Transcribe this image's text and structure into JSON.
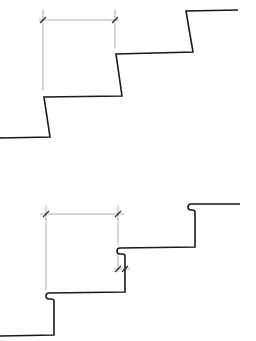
{
  "figure": {
    "diagrams": [
      {
        "id": "top",
        "label": "stair profile with sloped risers, no nosing",
        "profile_points": "0,138 50,137 44,97 122,96 116,54 193,52 186,11 238,10",
        "dimension": {
          "ext_left": "43,10 43,91",
          "ext_right": "115,10 115,48",
          "line": "39,20 119,20",
          "ticks": [
            [
              40,
              23,
              46,
              17
            ],
            [
              112,
              23,
              118,
              17
            ]
          ]
        }
      },
      {
        "id": "bottom",
        "label": "stair profile with vertical risers and rounded nosings",
        "profile_path": "M0,336 L54,335 L54,301 Q54,299 51,299 L49,299 Q46,299 46,296 Q46,293 49,293 L125,292 L125,256 Q125,254 122,254 L120,254 Q117,254 117,251 Q117,248 120,248 L195,247 L195,212 Q195,210 192,210 L191,210 Q188,210 188,207 Q188,204 191,204 L240,204",
        "dimension": {
          "ext_left": "46,205 46,290",
          "ext_right": "118,205 118,244",
          "line": "40,214 124,214",
          "ticks": [
            [
              43,
              217,
              49,
              211
            ],
            [
              115,
              217,
              121,
              211
            ]
          ]
        },
        "nosing_dimension": {
          "ext_left": "118,254 118,272",
          "line": "114,269 130,269",
          "ticks": [
            [
              115,
              272,
              121,
              266
            ],
            [
              122,
              272,
              128,
              266
            ]
          ]
        }
      }
    ]
  }
}
